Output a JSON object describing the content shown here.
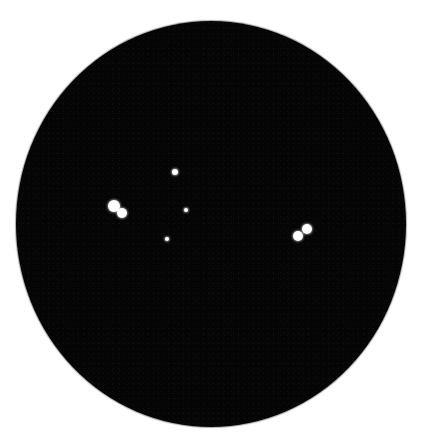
{
  "image": {
    "subject": "star field in circular eyepiece view",
    "field_color": "#050505",
    "background_color": "#ffffff",
    "field": {
      "center_x": 210,
      "center_y": 224,
      "width": 390,
      "height": 406
    }
  },
  "stars": [
    {
      "id": "star-left-a",
      "x": 114,
      "y": 206,
      "d": 12
    },
    {
      "id": "star-left-b",
      "x": 122,
      "y": 213,
      "d": 10
    },
    {
      "id": "star-top",
      "x": 175,
      "y": 172,
      "d": 6
    },
    {
      "id": "star-center",
      "x": 186,
      "y": 210,
      "d": 4
    },
    {
      "id": "star-lower",
      "x": 167,
      "y": 239,
      "d": 4
    },
    {
      "id": "star-right-a",
      "x": 307,
      "y": 229,
      "d": 10
    },
    {
      "id": "star-right-b",
      "x": 298,
      "y": 236,
      "d": 10
    }
  ]
}
